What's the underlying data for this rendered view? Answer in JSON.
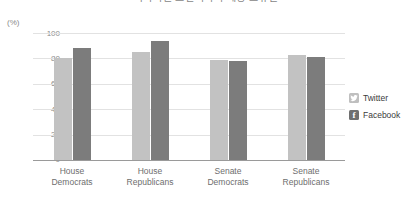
{
  "chart_data": {
    "type": "bar",
    "title": "국회의원 소셜미디어 계정 보유율",
    "subtitle": "",
    "xlabel": "",
    "ylabel": "(%)",
    "ylim": [
      0,
      100
    ],
    "yticks": [
      0,
      20,
      40,
      60,
      80,
      100
    ],
    "grid": true,
    "legend_position": "right",
    "categories": [
      "House\nDemocrats",
      "House\nRepublicans",
      "Senate\nDemocrats",
      "Senate\nRepublicans"
    ],
    "series": [
      {
        "name": "Twitter",
        "color": "#c2c2c2",
        "values": [
          80,
          85,
          79,
          83
        ]
      },
      {
        "name": "Facebook",
        "color": "#7c7c7c",
        "values": [
          88,
          94,
          78,
          81
        ]
      }
    ]
  },
  "axis": {
    "unit_label": "(%)",
    "ticks": [
      "100",
      "80",
      "60",
      "40",
      "20",
      "0"
    ]
  },
  "categories": [
    {
      "line1": "House",
      "line2": "Democrats"
    },
    {
      "line1": "House",
      "line2": "Republicans"
    },
    {
      "line1": "Senate",
      "line2": "Democrats"
    },
    {
      "line1": "Senate",
      "line2": "Republicans"
    }
  ],
  "legend": [
    {
      "label": "Twitter",
      "icon": "twitter-bird-icon"
    },
    {
      "label": "Facebook",
      "icon": "facebook-f-icon",
      "glyph": "f"
    }
  ],
  "title": {
    "text": "국회의원 소셜미디어 계정 보유율"
  }
}
